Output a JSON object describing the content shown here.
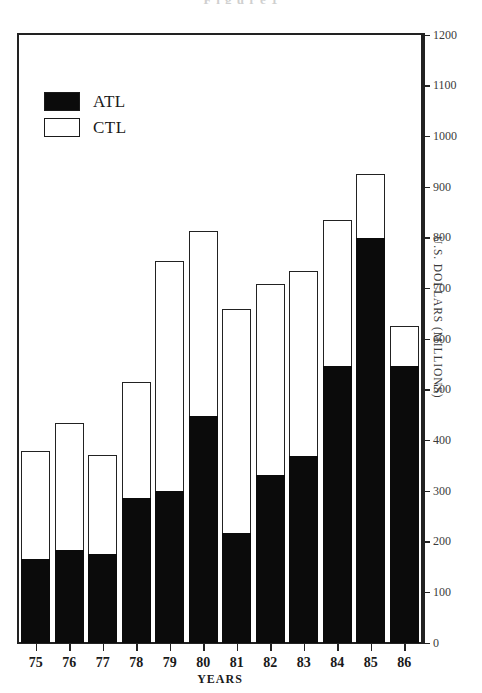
{
  "chart_data": {
    "type": "bar",
    "stacked": true,
    "title": "",
    "xlabel": "YEARS",
    "ylabel": "U.S. DOLLARS (MILLIONS)",
    "ylabel_position": "right",
    "categories": [
      "75",
      "76",
      "77",
      "78",
      "79",
      "80",
      "81",
      "82",
      "83",
      "84",
      "85",
      "86"
    ],
    "ylim": [
      0,
      1200
    ],
    "ytick_step": 100,
    "yticks": [
      0,
      100,
      200,
      300,
      400,
      500,
      600,
      700,
      800,
      900,
      1000,
      1100,
      1200
    ],
    "grid": false,
    "legend_position": "top-left",
    "series": [
      {
        "name": "ATL",
        "color": "#0b0b0b",
        "values": [
          166,
          183,
          175,
          286,
          300,
          449,
          217,
          331,
          369,
          546,
          800,
          546
        ]
      },
      {
        "name": "CTL",
        "color": "#ffffff",
        "values": [
          212,
          251,
          196,
          230,
          453,
          365,
          443,
          378,
          366,
          289,
          126,
          79
        ]
      }
    ],
    "totals": [
      378,
      434,
      371,
      516,
      753,
      814,
      660,
      709,
      735,
      835,
      926,
      625
    ],
    "annotations": []
  },
  "legend": {
    "items": [
      {
        "label": "ATL",
        "swatch": "filled"
      },
      {
        "label": "CTL",
        "swatch": "hollow"
      }
    ]
  },
  "axes": {
    "y_title": "U.S. DOLLARS (MILLIONS)",
    "x_title": "YEARS"
  },
  "clipped_title": "F i g u r e  1"
}
